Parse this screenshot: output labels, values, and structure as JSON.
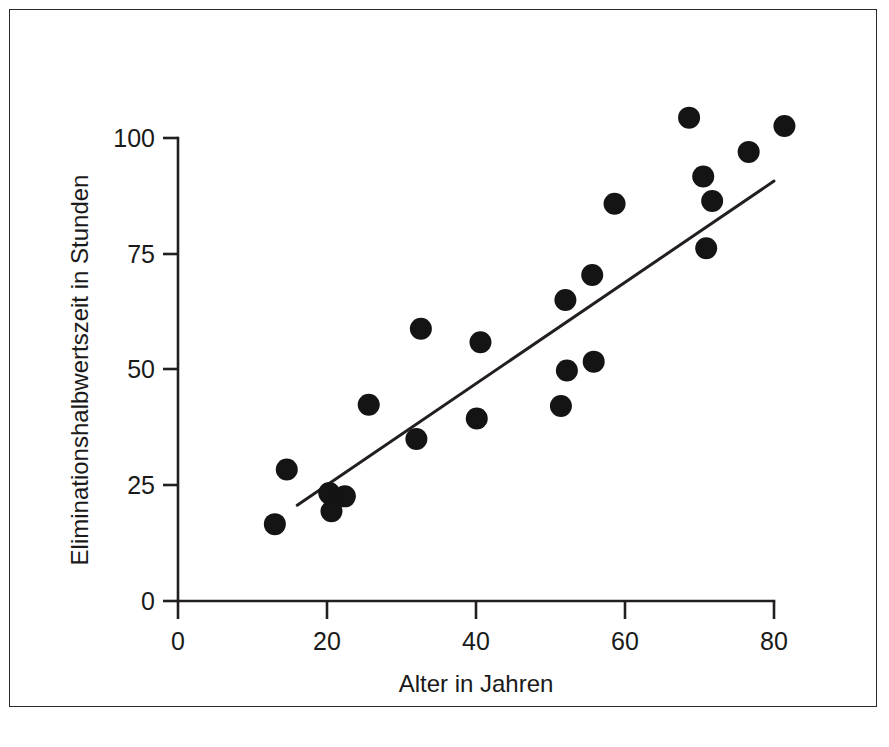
{
  "figure": {
    "background_color": "#ffffff",
    "frame_color": "#2a2a2a",
    "ink_color": "#231f20",
    "marker_color": "#141414"
  },
  "chart_data": {
    "type": "scatter",
    "title": "",
    "subtitle": "",
    "xlabel": "Alter in Jahren",
    "ylabel": "Eliminationshalbwertszeit in Stunden",
    "xlim": [
      0,
      84
    ],
    "ylim": [
      0,
      108
    ],
    "xticks": [
      0,
      20,
      40,
      60,
      80
    ],
    "xticklabels": [
      "0",
      "20",
      "40",
      "60",
      "80"
    ],
    "yticks": [
      0,
      25,
      50,
      75,
      100
    ],
    "yticklabels": [
      "0",
      "25",
      "50",
      "75",
      "100"
    ],
    "grid": false,
    "legend": null,
    "annotations": [],
    "series": [
      {
        "name": "Patienten",
        "marker": "filled-circle",
        "marker_size": 11,
        "points": [
          {
            "x": 13.0,
            "y": 16.6
          },
          {
            "x": 14.6,
            "y": 28.4
          },
          {
            "x": 20.3,
            "y": 23.3
          },
          {
            "x": 20.6,
            "y": 19.4
          },
          {
            "x": 22.4,
            "y": 22.6
          },
          {
            "x": 25.6,
            "y": 42.4
          },
          {
            "x": 32.0,
            "y": 35.0
          },
          {
            "x": 32.6,
            "y": 58.8
          },
          {
            "x": 40.1,
            "y": 39.4
          },
          {
            "x": 40.6,
            "y": 55.9
          },
          {
            "x": 51.4,
            "y": 42.1
          },
          {
            "x": 52.2,
            "y": 49.8
          },
          {
            "x": 52.0,
            "y": 65.0
          },
          {
            "x": 55.8,
            "y": 51.7
          },
          {
            "x": 55.6,
            "y": 70.4
          },
          {
            "x": 58.6,
            "y": 85.8
          },
          {
            "x": 68.6,
            "y": 104.4
          },
          {
            "x": 70.5,
            "y": 91.7
          },
          {
            "x": 70.9,
            "y": 76.2
          },
          {
            "x": 71.7,
            "y": 86.4
          },
          {
            "x": 76.6,
            "y": 97.0
          },
          {
            "x": 81.4,
            "y": 102.6
          }
        ]
      }
    ],
    "fit_line": {
      "name": "Regressionsgerade",
      "x_start": 16.0,
      "y_start": 20.7,
      "x_end": 80.0,
      "y_end": 90.7
    }
  }
}
